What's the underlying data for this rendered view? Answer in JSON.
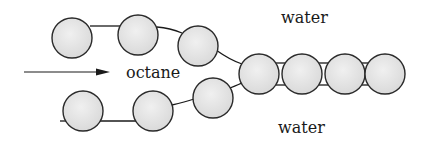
{
  "diagram": {
    "labels": {
      "top_phase": "water",
      "middle_phase": "octane",
      "bottom_phase": "water"
    },
    "colors": {
      "background": "#ffffff",
      "bead_fill": "#e6e6e6",
      "bead_stroke": "#2a2a2a",
      "line": "#1a1a1a"
    },
    "top_strand_beads": 3,
    "bottom_strand_beads": 3,
    "merged_chain_beads": 4,
    "arrow": "flow-direction-arrow"
  }
}
